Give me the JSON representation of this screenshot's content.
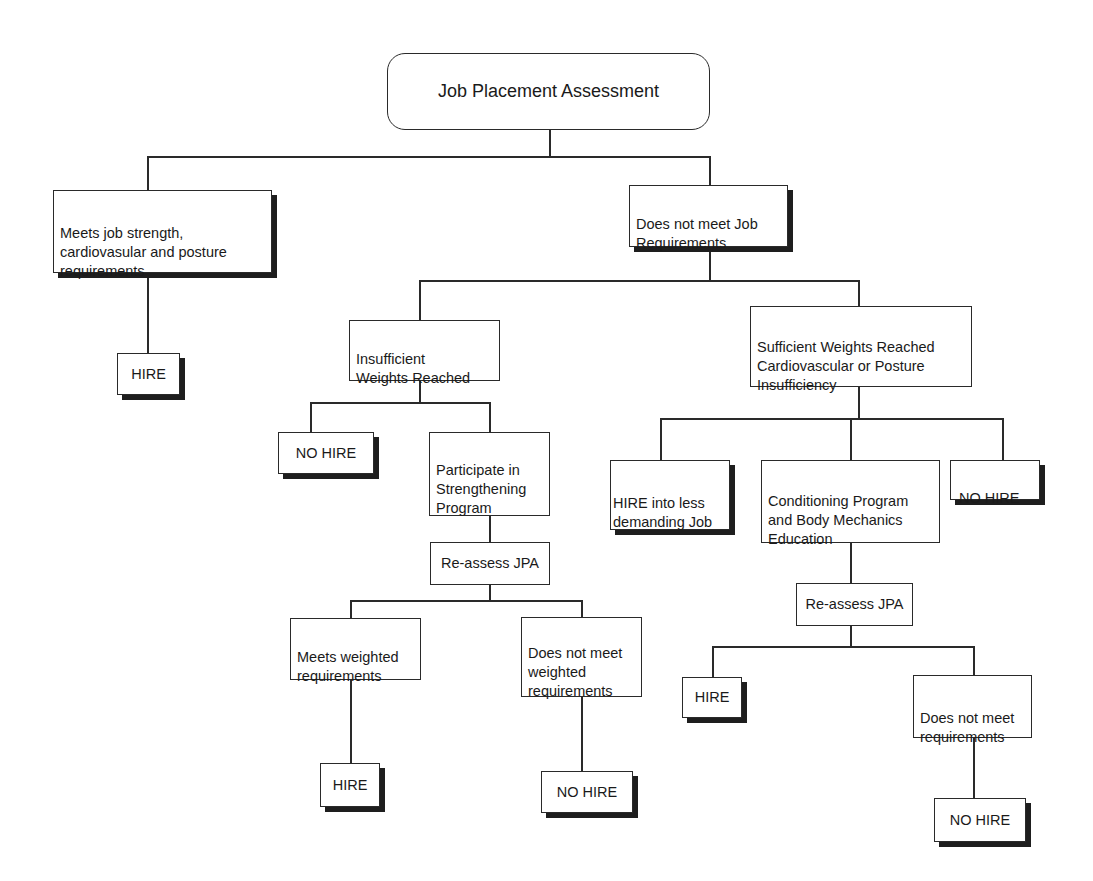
{
  "diagram": {
    "type": "flowchart",
    "root": {
      "label": "Job Placement Assessment"
    },
    "nodes": {
      "meets_job": {
        "label": "Meets job strength,\ncardiovasular and posture\nrequirements"
      },
      "hire_1": {
        "label": "HIRE"
      },
      "does_not_meet_job": {
        "label": "Does not meet Job\nRequirements"
      },
      "insufficient_weights": {
        "label": "Insufficient\nWeights Reached"
      },
      "sufficient_weights": {
        "label": "Sufficient Weights Reached\nCardiovascular or Posture\nInsufficiency"
      },
      "no_hire_1": {
        "label": "NO HIRE"
      },
      "strengthening": {
        "label": "Participate in\nStrengthening\nProgram"
      },
      "reassess_1": {
        "label": "Re-assess JPA"
      },
      "meets_weighted": {
        "label": "Meets weighted\nrequirements"
      },
      "not_meets_weighted": {
        "label": "Does not meet\nweighted\nrequirements"
      },
      "hire_2": {
        "label": "HIRE"
      },
      "no_hire_2": {
        "label": "NO HIRE"
      },
      "hire_less_demanding": {
        "label": "HIRE into less\ndemanding Job"
      },
      "conditioning": {
        "label": "Conditioning Program\nand Body Mechanics\nEducation"
      },
      "no_hire_3": {
        "label": "NO HIRE"
      },
      "reassess_2": {
        "label": "Re-assess JPA"
      },
      "hire_3": {
        "label": "HIRE"
      },
      "not_meets_requirements": {
        "label": "Does not meet\nrequirements"
      },
      "no_hire_4": {
        "label": "NO HIRE"
      }
    },
    "edges": [
      [
        "root",
        "meets_job"
      ],
      [
        "root",
        "does_not_meet_job"
      ],
      [
        "meets_job",
        "hire_1"
      ],
      [
        "does_not_meet_job",
        "insufficient_weights"
      ],
      [
        "does_not_meet_job",
        "sufficient_weights"
      ],
      [
        "insufficient_weights",
        "no_hire_1"
      ],
      [
        "insufficient_weights",
        "strengthening"
      ],
      [
        "strengthening",
        "reassess_1"
      ],
      [
        "reassess_1",
        "meets_weighted"
      ],
      [
        "reassess_1",
        "not_meets_weighted"
      ],
      [
        "meets_weighted",
        "hire_2"
      ],
      [
        "not_meets_weighted",
        "no_hire_2"
      ],
      [
        "sufficient_weights",
        "hire_less_demanding"
      ],
      [
        "sufficient_weights",
        "conditioning"
      ],
      [
        "sufficient_weights",
        "no_hire_3"
      ],
      [
        "conditioning",
        "reassess_2"
      ],
      [
        "reassess_2",
        "hire_3"
      ],
      [
        "reassess_2",
        "not_meets_requirements"
      ],
      [
        "not_meets_requirements",
        "no_hire_4"
      ]
    ]
  }
}
